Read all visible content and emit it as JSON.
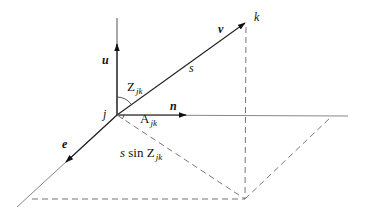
{
  "diagram": {
    "title": "",
    "points": {
      "j": {
        "label": "j",
        "x": 117,
        "y": 115
      },
      "k": {
        "label": "k",
        "x": 246,
        "y": 22
      },
      "foot": {
        "x": 245,
        "y": 199
      }
    },
    "vectors": [
      {
        "name": "u",
        "label": "u",
        "from": "j",
        "direction": "up"
      },
      {
        "name": "v",
        "label": "v",
        "from": "j",
        "to": "k"
      },
      {
        "name": "n",
        "label": "n",
        "from": "j",
        "direction": "right"
      },
      {
        "name": "e",
        "label": "e",
        "from": "j",
        "direction": "down-left"
      }
    ],
    "labels": {
      "u": "u",
      "v": "v",
      "n": "n",
      "e": "e",
      "k": "k",
      "j": "j",
      "s": "s",
      "zenith_main": "Z",
      "zenith_sub": "jk",
      "azimuth_main": "A",
      "azimuth_sub": "jk",
      "proj_prefix": "s sin ",
      "proj_main": "Z",
      "proj_sub": "jk"
    },
    "colors": {
      "solid_line": "#222222",
      "light_line": "#888888",
      "dashed_line": "#777777",
      "text": "#111111"
    }
  }
}
